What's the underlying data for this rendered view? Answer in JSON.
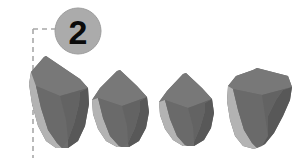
{
  "figure": {
    "background_color": "#ffffff",
    "width": 304,
    "height": 158
  },
  "callout": {
    "badge_label": "2",
    "badge_shape": "circle",
    "badge_fill": "#ababab",
    "badge_edge": "#9d9d9d",
    "badge_text_color": "#0b0b0b",
    "badge_center_x": 78,
    "badge_center_y": 31,
    "badge_radius": 23,
    "leader_style": "dashed",
    "leader_color": "#a8a8a8",
    "leader_name": "dashed-leader-line"
  },
  "palette": {
    "body_gray": "#6e6e6e",
    "top_face_gray": "#767676",
    "shadow_gray": "#585858",
    "highlight_gray": "#b3b3b3",
    "mid_gray": "#8a8a8a",
    "outline_gray": "#4f4f4f"
  },
  "objects": [
    {
      "name": "tooth-1",
      "label": "",
      "position": "leftmost",
      "shape": "tilted crown with angled flat top"
    },
    {
      "name": "tooth-2",
      "label": "",
      "position": "second",
      "shape": "peaked crown with concave flanks"
    },
    {
      "name": "tooth-3",
      "label": "",
      "position": "third",
      "shape": "peaked crown with concave flanks"
    },
    {
      "name": "tooth-4",
      "label": "",
      "position": "rightmost",
      "shape": "tilted crown leaning right"
    }
  ]
}
